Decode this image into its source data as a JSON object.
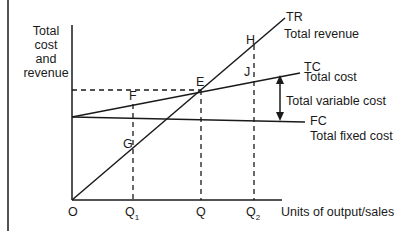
{
  "diagram": {
    "type": "break-even chart",
    "y_axis_label": "Total cost and revenue",
    "y_axis_lines": [
      "Total",
      "cost",
      "and",
      "revenue"
    ],
    "x_axis_label": "Units of output/sales",
    "origin_label": "O",
    "x_ticks": [
      {
        "label": "Q",
        "sub": "1",
        "x": 133
      },
      {
        "label": "Q",
        "sub": "",
        "x": 201
      },
      {
        "label": "Q",
        "sub": "2",
        "x": 254
      }
    ],
    "lines": {
      "tr": {
        "code": "TR",
        "name": "Total revenue"
      },
      "tc": {
        "code": "TC",
        "name": "Total cost"
      },
      "fc": {
        "code": "FC",
        "name": "Total fixed cost"
      }
    },
    "annotation": "Total variable cost",
    "points": {
      "e": "E",
      "f": "F",
      "g": "G",
      "h": "H",
      "j": "J"
    },
    "colors": {
      "line": "#1a1a1a",
      "background": "#ffffff"
    }
  }
}
